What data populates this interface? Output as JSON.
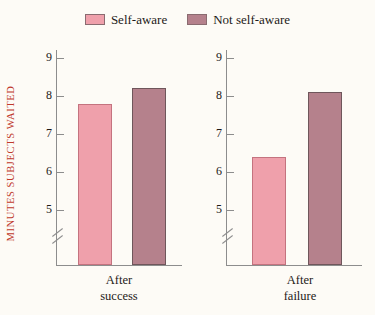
{
  "legend": {
    "entries": [
      {
        "label": "Self-aware",
        "color": "#efa0ab"
      },
      {
        "label": "Not self-aware",
        "color": "#b5818c"
      }
    ]
  },
  "axis": {
    "ylabel": "MINUTES SUBJECTS WAITED",
    "ylabel_color": "#c0392b",
    "ticks": [
      "9",
      "8",
      "7",
      "6",
      "5"
    ],
    "broken_axis": true
  },
  "panels": [
    {
      "name": "after-success",
      "label_line1": "After",
      "label_line2": "success",
      "bars": [
        {
          "series": "Self-aware",
          "value": 7.8
        },
        {
          "series": "Not self-aware",
          "value": 8.2
        }
      ]
    },
    {
      "name": "after-failure",
      "label_line1": "After",
      "label_line2": "failure",
      "bars": [
        {
          "series": "Self-aware",
          "value": 6.4
        },
        {
          "series": "Not self-aware",
          "value": 8.1
        }
      ]
    }
  ],
  "chart_data": {
    "type": "bar",
    "title": "",
    "xlabel": "",
    "ylabel": "MINUTES SUBJECTS WAITED",
    "categories": [
      "After success",
      "After failure"
    ],
    "series": [
      {
        "name": "Self-aware",
        "values": [
          7.8,
          6.4
        ],
        "color": "#efa0ab"
      },
      {
        "name": "Not self-aware",
        "values": [
          8.2,
          8.1
        ],
        "color": "#b5818c"
      }
    ],
    "ylim": [
      4.5,
      9.4
    ],
    "yticks": [
      5,
      6,
      7,
      8,
      9
    ],
    "axis_break": "y-axis broken below 5",
    "grid": false,
    "legend_position": "top-center"
  }
}
